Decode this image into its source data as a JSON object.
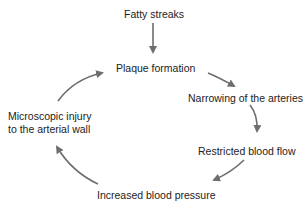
{
  "diagram": {
    "type": "cycle",
    "colors": {
      "text": "#222222",
      "arrow": "#6e6e6e",
      "background": "#ffffff"
    },
    "entry": {
      "label": "Fatty streaks"
    },
    "nodes": [
      {
        "id": "plaque",
        "label": "Plaque formation"
      },
      {
        "id": "narrowing",
        "label": "Narrowing of the arteries"
      },
      {
        "id": "restricted",
        "label": "Restricted blood flow"
      },
      {
        "id": "pressure",
        "label": "Increased blood pressure"
      },
      {
        "id": "injury",
        "label_line1": "Microscopic injury",
        "label_line2": "to the arterial wall"
      }
    ],
    "edges": [
      {
        "from": "Fatty streaks",
        "to": "Plaque formation"
      },
      {
        "from": "Plaque formation",
        "to": "Narrowing of the arteries"
      },
      {
        "from": "Narrowing of the arteries",
        "to": "Restricted blood flow"
      },
      {
        "from": "Restricted blood flow",
        "to": "Increased blood pressure"
      },
      {
        "from": "Increased blood pressure",
        "to": "Microscopic injury to the arterial wall"
      },
      {
        "from": "Microscopic injury to the arterial wall",
        "to": "Plaque formation"
      }
    ]
  }
}
